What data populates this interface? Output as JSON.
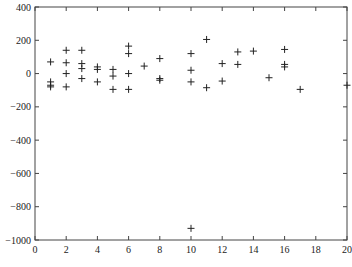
{
  "chart_data": {
    "type": "scatter",
    "title": "",
    "xlabel": "",
    "ylabel": "",
    "xlim": [
      0,
      20
    ],
    "ylim": [
      -1000,
      400
    ],
    "grid": false,
    "legend": null,
    "marker": "+",
    "marker_color": "#222222",
    "x_ticks": [
      0,
      2,
      4,
      6,
      8,
      10,
      12,
      14,
      16,
      18,
      20
    ],
    "y_ticks": [
      400,
      200,
      0,
      -200,
      -400,
      -600,
      -800,
      -1000
    ],
    "x_tick_labels": [
      "0",
      "2",
      "4",
      "6",
      "8",
      "10",
      "12",
      "14",
      "16",
      "18",
      "20"
    ],
    "y_tick_labels": [
      "400",
      "200",
      "0",
      "−200",
      "−400",
      "−600",
      "−800",
      "−1000"
    ],
    "points": [
      {
        "x": 1,
        "y": 70
      },
      {
        "x": 1,
        "y": -50
      },
      {
        "x": 1,
        "y": -70
      },
      {
        "x": 1,
        "y": -80
      },
      {
        "x": 2,
        "y": 140
      },
      {
        "x": 2,
        "y": 65
      },
      {
        "x": 2,
        "y": 0
      },
      {
        "x": 2,
        "y": -80
      },
      {
        "x": 3,
        "y": 140
      },
      {
        "x": 3,
        "y": 60
      },
      {
        "x": 3,
        "y": 30
      },
      {
        "x": 3,
        "y": -30
      },
      {
        "x": 4,
        "y": 40
      },
      {
        "x": 4,
        "y": 25
      },
      {
        "x": 4,
        "y": -50
      },
      {
        "x": 5,
        "y": 25
      },
      {
        "x": 5,
        "y": -15
      },
      {
        "x": 5,
        "y": -95
      },
      {
        "x": 6,
        "y": 165
      },
      {
        "x": 6,
        "y": 120
      },
      {
        "x": 6,
        "y": 0
      },
      {
        "x": 6,
        "y": -95
      },
      {
        "x": 7,
        "y": 45
      },
      {
        "x": 8,
        "y": 90
      },
      {
        "x": 8,
        "y": -30
      },
      {
        "x": 8,
        "y": -40
      },
      {
        "x": 10,
        "y": 120
      },
      {
        "x": 10,
        "y": 20
      },
      {
        "x": 10,
        "y": -50
      },
      {
        "x": 10,
        "y": -930
      },
      {
        "x": 11,
        "y": 205
      },
      {
        "x": 11,
        "y": -85
      },
      {
        "x": 12,
        "y": 60
      },
      {
        "x": 12,
        "y": -45
      },
      {
        "x": 13,
        "y": 130
      },
      {
        "x": 13,
        "y": 55
      },
      {
        "x": 14,
        "y": 135
      },
      {
        "x": 15,
        "y": -25
      },
      {
        "x": 16,
        "y": 145
      },
      {
        "x": 16,
        "y": 55
      },
      {
        "x": 16,
        "y": 40
      },
      {
        "x": 17,
        "y": -95
      },
      {
        "x": 20,
        "y": -70
      }
    ]
  }
}
